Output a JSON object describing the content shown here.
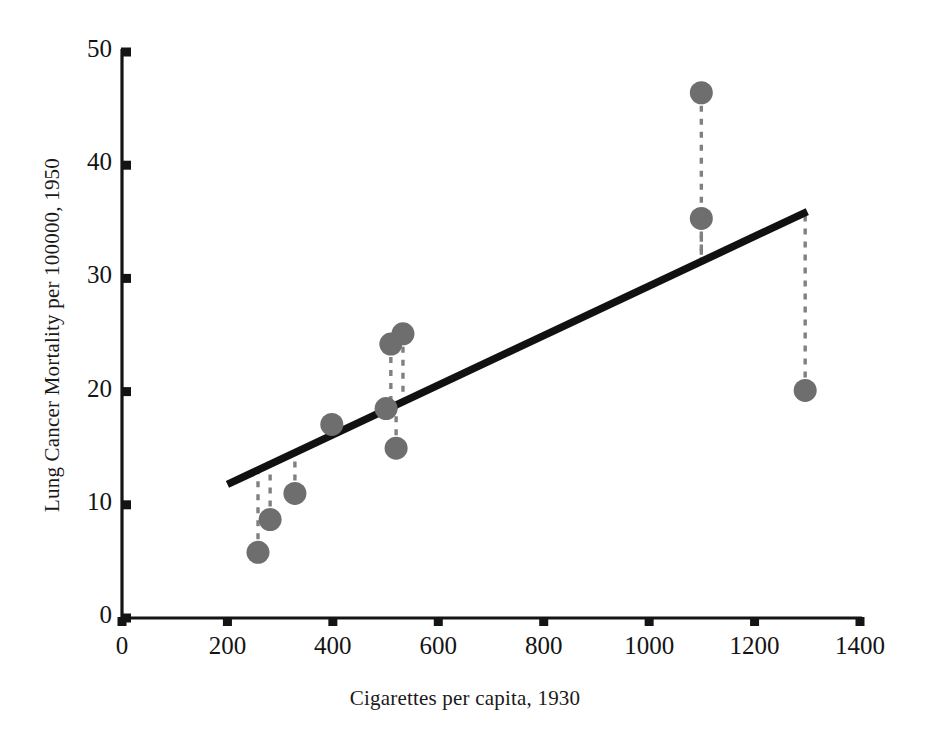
{
  "chart_data": {
    "type": "scatter",
    "title": "",
    "xlabel": "Cigarettes per capita, 1930",
    "ylabel": "Lung Cancer Mortality per 100000, 1950",
    "xlim": [
      0,
      1400
    ],
    "ylim": [
      0,
      50
    ],
    "xticks": [
      0,
      200,
      400,
      600,
      800,
      1000,
      1200,
      1400
    ],
    "xticklabels": [
      "0",
      "200",
      "400",
      "600",
      "800",
      "1000",
      "1200",
      "1400"
    ],
    "yticks": [
      0,
      10,
      20,
      30,
      40,
      50
    ],
    "yticklabels": [
      "0",
      "10",
      "20",
      "30",
      "40",
      "50"
    ],
    "grid": false,
    "legend": "none",
    "marker_color": "#6e6e6e",
    "line_color": "#111111",
    "residual_color": "#808080",
    "axis_color": "#141414",
    "points": [
      {
        "x": 258,
        "y": 5.8
      },
      {
        "x": 281,
        "y": 8.7
      },
      {
        "x": 328,
        "y": 11.0
      },
      {
        "x": 398,
        "y": 17.1
      },
      {
        "x": 501,
        "y": 18.5
      },
      {
        "x": 510,
        "y": 24.2
      },
      {
        "x": 533,
        "y": 25.1
      },
      {
        "x": 520,
        "y": 15.0
      },
      {
        "x": 1099,
        "y": 46.4
      },
      {
        "x": 1099,
        "y": 35.3
      },
      {
        "x": 1296,
        "y": 20.1
      }
    ],
    "fit_line": {
      "label": "least-squares regression line",
      "x_start": 200,
      "y_start": 11.8,
      "x_end": 1300,
      "y_end": 35.9
    },
    "residual_lines": [
      {
        "x": 258,
        "y_point": 5.8,
        "y_fit": 13.1
      },
      {
        "x": 281,
        "y_point": 8.7,
        "y_fit": 13.6
      },
      {
        "x": 328,
        "y_point": 11.0,
        "y_fit": 14.6
      },
      {
        "x": 398,
        "y_point": 17.1,
        "y_fit": 16.1
      },
      {
        "x": 501,
        "y_point": 18.5,
        "y_fit": 18.4
      },
      {
        "x": 510,
        "y_point": 24.2,
        "y_fit": 18.6
      },
      {
        "x": 533,
        "y_point": 25.1,
        "y_fit": 19.1
      },
      {
        "x": 520,
        "y_point": 15.0,
        "y_fit": 18.8
      },
      {
        "x": 1099,
        "y_point": 46.4,
        "y_fit": 31.5
      },
      {
        "x": 1099,
        "y_point": 35.3,
        "y_fit": 31.5
      },
      {
        "x": 1296,
        "y_point": 20.1,
        "y_fit": 35.8
      }
    ]
  }
}
